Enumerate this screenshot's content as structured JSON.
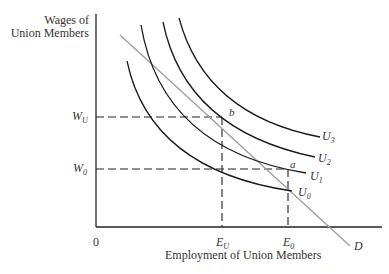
{
  "diagram": {
    "type": "economics-indifference-curves",
    "y_axis_label_line1": "Wages of",
    "y_axis_label_line2": "Union Members",
    "x_axis_label": "Employment of Union Members",
    "origin_label": "0",
    "wage_levels": [
      {
        "id": "W_U",
        "base": "W",
        "sub": "U"
      },
      {
        "id": "W_0",
        "base": "W",
        "sub": "0"
      }
    ],
    "employment_levels": [
      {
        "id": "E_U",
        "base": "E",
        "sub": "U"
      },
      {
        "id": "E_0",
        "base": "E",
        "sub": "0"
      }
    ],
    "points": [
      {
        "label": "b",
        "at": "W_U, E_U"
      },
      {
        "label": "a",
        "at": "W_0, E_0"
      }
    ],
    "curves": [
      {
        "id": "U_0",
        "base": "U",
        "sub": "0",
        "kind": "indifference"
      },
      {
        "id": "U_1",
        "base": "U",
        "sub": "1",
        "kind": "indifference"
      },
      {
        "id": "U_2",
        "base": "U",
        "sub": "2",
        "kind": "indifference"
      },
      {
        "id": "U_3",
        "base": "U",
        "sub": "3",
        "kind": "indifference"
      },
      {
        "id": "D",
        "base": "D",
        "sub": "",
        "kind": "demand",
        "color": "#a0a0a0"
      }
    ],
    "colors": {
      "axes": "#222222",
      "curves": "#1a1a1a",
      "demand": "#a0a0a0"
    }
  }
}
